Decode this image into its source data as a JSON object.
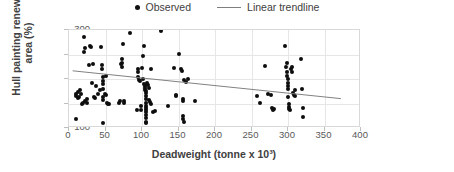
{
  "chart_data": {
    "type": "scatter",
    "title": "",
    "xlabel": "Deadweight (tonne x 10³)",
    "ylabel": "Hull painting renewal area (%)",
    "xlim": [
      0,
      400
    ],
    "ylim": [
      100,
      300
    ],
    "xticks": [
      0,
      50,
      100,
      150,
      200,
      250,
      300,
      350,
      400
    ],
    "yticks": [
      100,
      150,
      200,
      250,
      300
    ],
    "grid": true,
    "legend_position": "top-center",
    "series": [
      {
        "name": "Observed",
        "type": "scatter",
        "marker": "circle",
        "color": "#0d0d0d",
        "points": [
          [
            10,
            119
          ],
          [
            9,
            166
          ],
          [
            10,
            170
          ],
          [
            12,
            174
          ],
          [
            13,
            162
          ],
          [
            14,
            163
          ],
          [
            15,
            177
          ],
          [
            17,
            169
          ],
          [
            18,
            150
          ],
          [
            19,
            152
          ],
          [
            20,
            255
          ],
          [
            21,
            285
          ],
          [
            22,
            264
          ],
          [
            22,
            156
          ],
          [
            24,
            160
          ],
          [
            25,
            152
          ],
          [
            27,
            229
          ],
          [
            29,
            267
          ],
          [
            30,
            265
          ],
          [
            31,
            192
          ],
          [
            33,
            231
          ],
          [
            34,
            163
          ],
          [
            35,
            161
          ],
          [
            37,
            186
          ],
          [
            40,
            169
          ],
          [
            42,
            177
          ],
          [
            44,
            265
          ],
          [
            45,
            228
          ],
          [
            45,
            221
          ],
          [
            46,
            205
          ],
          [
            46,
            196
          ],
          [
            46,
            189
          ],
          [
            46,
            180
          ],
          [
            47,
            163
          ],
          [
            47,
            158
          ],
          [
            47,
            111
          ],
          [
            49,
            170
          ],
          [
            50,
            207
          ],
          [
            51,
            168
          ],
          [
            52,
            152
          ],
          [
            53,
            149
          ],
          [
            55,
            150
          ],
          [
            68,
            152
          ],
          [
            70,
            156
          ],
          [
            71,
            230
          ],
          [
            72,
            240
          ],
          [
            72,
            225
          ],
          [
            73,
            232
          ],
          [
            74,
            271
          ],
          [
            75,
            156
          ],
          [
            76,
            151
          ],
          [
            84,
            293
          ],
          [
            93,
            137
          ],
          [
            94,
            221
          ],
          [
            95,
            214
          ],
          [
            95,
            204
          ],
          [
            96,
            198
          ],
          [
            97,
            196
          ],
          [
            98,
            144
          ],
          [
            99,
            137
          ],
          [
            100,
            222
          ],
          [
            101,
            201
          ],
          [
            102,
            246
          ],
          [
            103,
            267
          ],
          [
            103,
            189
          ],
          [
            104,
            186
          ],
          [
            104,
            182
          ],
          [
            104,
            178
          ],
          [
            105,
            175
          ],
          [
            105,
            171
          ],
          [
            105,
            166
          ],
          [
            105,
            159
          ],
          [
            105,
            152
          ],
          [
            105,
            145
          ],
          [
            105,
            141
          ],
          [
            105,
            137
          ],
          [
            105,
            132
          ],
          [
            105,
            127
          ],
          [
            105,
            120
          ],
          [
            105,
            113
          ],
          [
            106,
            110
          ],
          [
            107,
            191
          ],
          [
            108,
            188
          ],
          [
            109,
            182
          ],
          [
            110,
            157
          ],
          [
            111,
            153
          ],
          [
            112,
            221
          ],
          [
            113,
            150
          ],
          [
            115,
            133
          ],
          [
            118,
            135
          ],
          [
            126,
            298
          ],
          [
            135,
            145
          ],
          [
            144,
            222
          ],
          [
            146,
            168
          ],
          [
            147,
            165
          ],
          [
            150,
            251
          ],
          [
            153,
            221
          ],
          [
            155,
            217
          ],
          [
            156,
            159
          ],
          [
            156,
            155
          ],
          [
            156,
            124
          ],
          [
            156,
            119
          ],
          [
            157,
            113
          ],
          [
            158,
            197
          ],
          [
            160,
            193
          ],
          [
            163,
            199
          ],
          [
            172,
            156
          ],
          [
            258,
            165
          ],
          [
            262,
            151
          ],
          [
            268,
            227
          ],
          [
            272,
            170
          ],
          [
            277,
            168
          ],
          [
            278,
            140
          ],
          [
            279,
            136
          ],
          [
            281,
            138
          ],
          [
            296,
            268
          ],
          [
            297,
            224
          ],
          [
            298,
            214
          ],
          [
            299,
            233
          ],
          [
            299,
            206
          ],
          [
            300,
            200
          ],
          [
            300,
            191
          ],
          [
            300,
            186
          ],
          [
            300,
            180
          ],
          [
            300,
            164
          ],
          [
            301,
            149
          ],
          [
            301,
            143
          ],
          [
            302,
            139
          ],
          [
            303,
            136
          ],
          [
            304,
            220
          ],
          [
            305,
            215
          ],
          [
            306,
            225
          ],
          [
            307,
            172
          ],
          [
            308,
            168
          ],
          [
            309,
            166
          ],
          [
            310,
            177
          ],
          [
            318,
            241
          ],
          [
            319,
            180
          ],
          [
            320,
            141
          ],
          [
            321,
            123
          ]
        ]
      },
      {
        "name": "Linear trendline",
        "type": "line",
        "color": "#7f7f7f",
        "x_start": 5,
        "y_start": 215,
        "x_end": 375,
        "y_end": 157
      }
    ]
  },
  "legend": {
    "entries": [
      {
        "label": "Observed",
        "marker": "dot"
      },
      {
        "label": "Linear trendline",
        "marker": "line"
      }
    ]
  },
  "colors": {
    "marker": "#0d0d0d",
    "trendline": "#7f7f7f",
    "gridline": "#e6e6e6",
    "frame": "#d9d9d9",
    "text": "#404040",
    "tick_text": "#595959"
  }
}
